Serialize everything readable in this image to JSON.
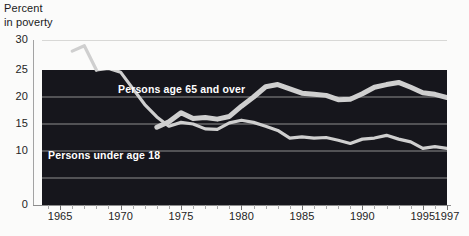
{
  "chart_data": {
    "type": "line",
    "title": "",
    "ylabel": "Percent\nin poverty",
    "xlabel": "",
    "ylim": [
      0,
      30
    ],
    "xlim": [
      1963.5,
      1997
    ],
    "yticks": [
      30,
      25,
      20,
      15,
      10,
      0
    ],
    "xticks": [
      1965,
      1970,
      1975,
      1980,
      1985,
      1990,
      1995,
      1997
    ],
    "grid": "horizontal",
    "legend_position": "inline-annotations",
    "series": [
      {
        "name": "Persons age 65 and over",
        "label_x": 1971.5,
        "label_y": 19.2,
        "x": [
          1966,
          1967,
          1968,
          1969,
          1970,
          1971,
          1972,
          1973,
          1974,
          1975,
          1976,
          1977,
          1978,
          1979,
          1980,
          1981,
          1982,
          1983,
          1984,
          1985,
          1986,
          1987,
          1988,
          1989,
          1990,
          1991,
          1992,
          1993,
          1994,
          1995,
          1996,
          1997
        ],
        "values": [
          28.5,
          29.5,
          25.0,
          25.3,
          24.6,
          21.6,
          18.6,
          16.3,
          14.6,
          15.3,
          15.0,
          14.1,
          14.0,
          15.2,
          15.7,
          15.3,
          14.6,
          13.8,
          12.4,
          12.6,
          12.4,
          12.5,
          12.0,
          11.4,
          12.2,
          12.4,
          12.9,
          12.2,
          11.7,
          10.5,
          10.8,
          10.5
        ]
      },
      {
        "name": "Persons under age 18",
        "label_x": 1965.3,
        "label_y": 11.6,
        "x": [
          1973,
          1974,
          1975,
          1976,
          1977,
          1978,
          1979,
          1980,
          1981,
          1982,
          1983,
          1984,
          1985,
          1986,
          1987,
          1988,
          1989,
          1990,
          1991,
          1992,
          1993,
          1994,
          1995,
          1996,
          1997
        ],
        "values": [
          14.4,
          15.4,
          17.1,
          16.0,
          16.2,
          15.9,
          16.4,
          18.3,
          20.0,
          21.9,
          22.3,
          21.5,
          20.7,
          20.5,
          20.3,
          19.5,
          19.6,
          20.6,
          21.8,
          22.3,
          22.7,
          21.8,
          20.8,
          20.5,
          19.9
        ]
      }
    ],
    "colors": {
      "plot_background": "#16161c",
      "page_background": "#fbfbfa",
      "line": "#cfcfcf",
      "gridline": "#9a9a9a",
      "tick_text": "#242424"
    }
  },
  "labels": {
    "axis_title": "Percent\nin poverty",
    "series_elderly": "Persons age 65 and over",
    "series_children": "Persons under age 18",
    "y": [
      "30",
      "25",
      "20",
      "15",
      "10",
      "0"
    ],
    "x": [
      "1965",
      "1970",
      "1975",
      "1980",
      "1985",
      "1990",
      "1995",
      "1997"
    ]
  }
}
